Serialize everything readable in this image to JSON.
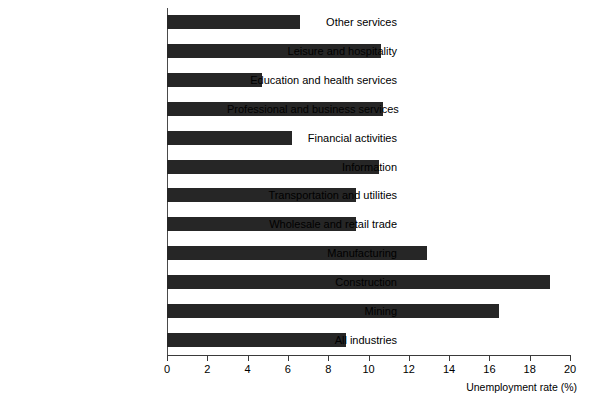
{
  "chart_data": {
    "type": "bar",
    "orientation": "horizontal",
    "title": "",
    "xlabel": "Unemployment rate (%)",
    "ylabel": "",
    "xlim": [
      0,
      20
    ],
    "xticks": [
      0,
      2,
      4,
      6,
      8,
      10,
      12,
      14,
      16,
      18,
      20
    ],
    "grid": false,
    "legend": null,
    "bar_color": "#262626",
    "background_color": "#ffffff",
    "categories": [
      "Other services",
      "Leisure and hospitality",
      "Education and health services",
      "Professional and business services",
      "Financial activities",
      "Information",
      "Transportation and utilities",
      "Wholesale and retail trade",
      "Manufacturing",
      "Construction",
      "Mining",
      "All industries"
    ],
    "values": [
      6.6,
      10.6,
      4.7,
      10.7,
      6.2,
      10.5,
      9.4,
      9.4,
      12.9,
      19.0,
      16.5,
      8.9
    ]
  },
  "axis": {
    "x_title": "Unemployment rate (%)"
  }
}
